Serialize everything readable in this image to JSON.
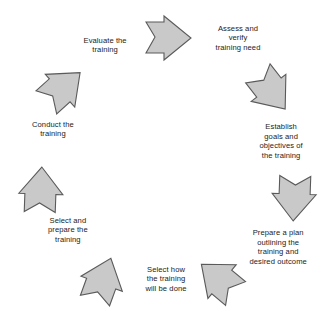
{
  "diagram": {
    "type": "circular-process-cycle",
    "title": "",
    "background_color": "#ffffff",
    "arrow_fill_color": "#c9c9c9",
    "arrow_outline_color": "#5a5a5a",
    "text_color": "#1b1b1b",
    "step_count": 7,
    "steps": [
      {
        "index": 1,
        "id": "assess-and-verify-training-need",
        "label": "Assess and\nverify\ntraining need",
        "arrow_icon": "block-arrow-icon",
        "arrow_direction": "right",
        "arrow_rotation_deg": 0,
        "arrow_center": [
          168,
          38
        ],
        "label_center": [
          238,
          38
        ]
      },
      {
        "index": 2,
        "id": "establish-goals-and-objectives",
        "label": "Establish\ngoals and\nobjectives of\nthe training",
        "arrow_icon": "block-arrow-icon",
        "arrow_direction": "down-right",
        "arrow_rotation_deg": 52,
        "arrow_center": [
          271,
          91
        ],
        "label_center": [
          281,
          141
        ]
      },
      {
        "index": 3,
        "id": "prepare-a-plan",
        "label": "Prepare a plan\noutlining the\ntraining and\ndesired outcome",
        "arrow_icon": "block-arrow-icon",
        "arrow_direction": "down",
        "arrow_rotation_deg": 92,
        "arrow_center": [
          294,
          198
        ],
        "label_center": [
          278,
          247
        ]
      },
      {
        "index": 4,
        "id": "select-how-training-will-be-done",
        "label": "Select how\nthe training\nwill be done",
        "arrow_icon": "block-arrow-icon",
        "arrow_direction": "down-left",
        "arrow_rotation_deg": 220,
        "arrow_center": [
          219,
          279
        ],
        "label_center": [
          166,
          279
        ]
      },
      {
        "index": 5,
        "id": "select-and-prepare-the-training",
        "label": "Select and\nprepare the\ntraining",
        "arrow_icon": "block-arrow-icon",
        "arrow_direction": "up-left",
        "arrow_rotation_deg": 290,
        "arrow_center": [
          103,
          280
        ],
        "label_center": [
          68,
          230
        ]
      },
      {
        "index": 6,
        "id": "conduct-the-training",
        "label": "Conduct the\ntraining",
        "arrow_icon": "block-arrow-icon",
        "arrow_direction": "up",
        "arrow_rotation_deg": 272,
        "arrow_center": [
          41,
          190
        ],
        "label_center": [
          53,
          129
        ]
      },
      {
        "index": 7,
        "id": "evaluate-the-training",
        "label": "Evaluate the\ntraining",
        "arrow_icon": "block-arrow-icon",
        "arrow_direction": "up-right",
        "arrow_rotation_deg": 318,
        "arrow_center": [
          63,
          88
        ],
        "label_center": [
          105,
          45
        ]
      }
    ]
  }
}
